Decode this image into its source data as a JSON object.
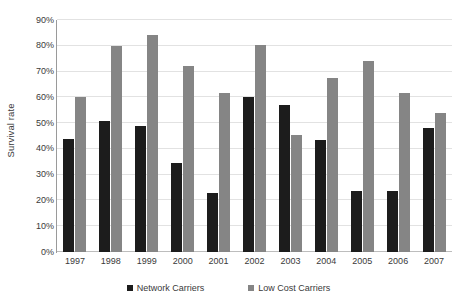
{
  "chart_data": {
    "type": "bar",
    "title": "",
    "subtitle": "",
    "xlabel": "",
    "ylabel": "Survival rate",
    "categories": [
      "1997",
      "1998",
      "1999",
      "2000",
      "2001",
      "2002",
      "2003",
      "2004",
      "2005",
      "2006",
      "2007"
    ],
    "series": [
      {
        "name": "Network Carriers",
        "color": "#1c1c1c",
        "values": [
          44,
          51,
          49,
          34.5,
          23,
          60,
          57,
          43.5,
          23.5,
          23.5,
          48
        ]
      },
      {
        "name": "Low Cost Carriers",
        "color": "#858585",
        "values": [
          60,
          80,
          84,
          72,
          61.5,
          80.5,
          45.5,
          67.5,
          74,
          61.5,
          54
        ]
      }
    ],
    "ylim": [
      0,
      90
    ],
    "ytick_values": [
      0,
      10,
      20,
      30,
      40,
      50,
      60,
      70,
      80,
      90
    ],
    "ytick_labels": [
      "0%",
      "10%",
      "20%",
      "30%",
      "40%",
      "50%",
      "60%",
      "70%",
      "80%",
      "90%"
    ],
    "grid": true,
    "grid_axis": "y",
    "legend_position": "bottom",
    "value_format": "percent"
  },
  "axes": {
    "y_title": "Survival rate"
  },
  "legend": {
    "entries": [
      {
        "label": "Network Carriers"
      },
      {
        "label": "Low Cost Carriers"
      }
    ]
  }
}
